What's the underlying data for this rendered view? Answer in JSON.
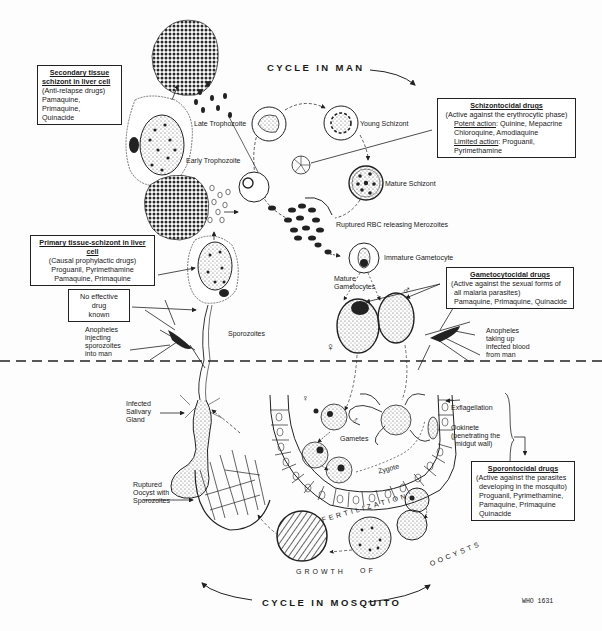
{
  "headings": {
    "cycle_in_man": "CYCLE IN MAN",
    "cycle_in_mosquito": "CYCLE IN MOSQUITO",
    "fertilization": "FERTILIZATION",
    "growth_of_oocysts": [
      "GROWTH",
      "OF",
      "OOCYSTS"
    ],
    "figure_ref": "WHO 1631"
  },
  "drug_boxes": {
    "secondary_tissue": {
      "title_lines": [
        "Secondary tissue",
        "schizont in liver cell"
      ],
      "subtitle": "(Anti-relapse drugs)",
      "drugs": [
        "Pamaquine, Primaquine,",
        "Quinacide"
      ]
    },
    "schizontocidal": {
      "title": "Schizontocidal drugs",
      "subtitle": "(Active against the erythrocytic phase)",
      "potent_label": "Potent action",
      "potent_drugs": ": Quinine, Mepacrine",
      "potent_drugs_2": "Chloroquine, Amodiaquine",
      "limited_label": "Limited action",
      "limited_drugs": ": Proguanil,",
      "limited_drugs_2": "Pyrimethamine"
    },
    "primary_tissue": {
      "title": "Primary tissue-schizont in liver cell",
      "subtitle": "(Causal prophylactic drugs)",
      "drugs": [
        "Proguanil, Pyrimethamine",
        "Pamaquine, Primaquine"
      ]
    },
    "no_drug": {
      "lines": [
        "No effective drug",
        "known"
      ]
    },
    "gametocytocidal": {
      "title": "Gametocytocidal drugs",
      "subtitle_lines": [
        "(Active against the sexual forms of",
        "all malaria parasites)"
      ],
      "drugs": "Pamaquine, Primaquine, Quinacide"
    },
    "sporontocidal": {
      "title": "Sporontocidal drugs",
      "subtitle_lines": [
        "(Active against the parasites",
        "developing in the mosquito)"
      ],
      "drugs": [
        "Proguanil, Pyrimethamine,",
        "Pamaquine, Primaquine",
        "Quinacide"
      ]
    }
  },
  "stage_labels": {
    "late_trophozoite": "Late Trophozoite",
    "early_trophozoite": "Early Trophozoite",
    "young_schizont": "Young Schizont",
    "mature_schizont": "Mature Schizont",
    "ruptured_rbc": "Ruptured RBC releasing Merozoites",
    "immature_gametocyte": "Immature Gametocyte",
    "mature_gametocytes": [
      "Mature",
      "Gametocytes"
    ],
    "sporozoites": "Sporozoites",
    "anopheles_injecting": [
      "Anopheles",
      "injecting",
      "sporozoites",
      "into man"
    ],
    "anopheles_taking": [
      "Anopheles",
      "taking up",
      "infected blood",
      "from man"
    ],
    "salivary_gland": [
      "Infected",
      "Salivary",
      "Gland"
    ],
    "exflagellation": "Exflagellation",
    "ookinete": [
      "Ookinete",
      "(penetrating the",
      "midgut wall)"
    ],
    "gametes": "Gametes",
    "zygote": "Zygote",
    "ruptured_oocyst": [
      "Ruptured",
      "Oocyst with",
      "Sporozoites"
    ]
  },
  "symbols": {
    "female": "♀",
    "male": "♂"
  }
}
